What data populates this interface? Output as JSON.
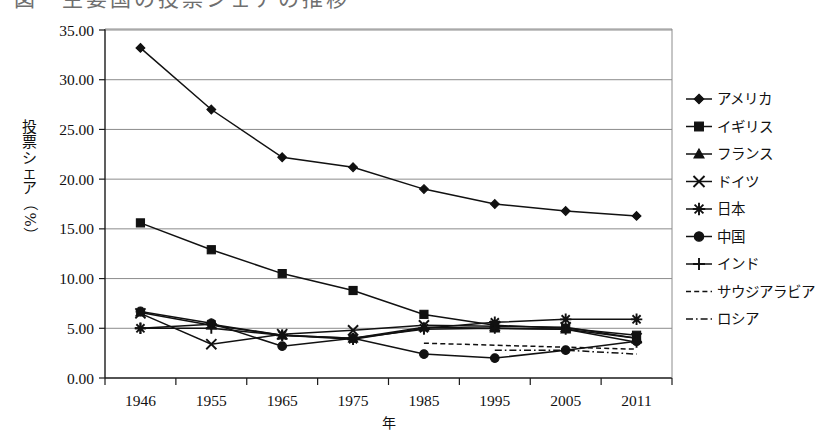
{
  "figure": {
    "title_clipped": "図　主要国の投票シェアの推移",
    "x_axis_title": "年",
    "y_axis_title_chars": [
      "投",
      "票",
      "シ",
      "ェ",
      "ア",
      "（",
      "%",
      "）"
    ],
    "colors": {
      "ink": "#111111",
      "grid": "#8c8c8c",
      "background": "#ffffff"
    }
  },
  "chart_data": {
    "type": "line",
    "title": "図　主要国の投票シェアの推移",
    "xlabel": "年",
    "ylabel": "投票シェア（%）",
    "categories": [
      "1946",
      "1955",
      "1965",
      "1975",
      "1985",
      "1995",
      "2005",
      "2011"
    ],
    "ylim": [
      0.0,
      35.0
    ],
    "ytick_step": 5.0,
    "ytick_labels": [
      "0.00",
      "5.00",
      "10.00",
      "15.00",
      "20.00",
      "25.00",
      "30.00",
      "35.00"
    ],
    "ytick_values": [
      0,
      5,
      10,
      15,
      20,
      25,
      30,
      35
    ],
    "grid": true,
    "grid_axis": "y",
    "legend_position": "right",
    "series": [
      {
        "name": "アメリカ",
        "marker": "diamond",
        "line": "solid",
        "values": [
          33.2,
          27.0,
          22.2,
          21.2,
          19.0,
          17.5,
          16.8,
          16.3
        ]
      },
      {
        "name": "イギリス",
        "marker": "square",
        "line": "solid",
        "values": [
          15.6,
          12.9,
          10.5,
          8.8,
          6.4,
          5.3,
          5.0,
          4.3
        ]
      },
      {
        "name": "フランス",
        "marker": "triangle",
        "line": "solid",
        "values": [
          6.6,
          5.3,
          4.3,
          4.0,
          5.1,
          5.0,
          4.9,
          4.0
        ]
      },
      {
        "name": "ドイツ",
        "marker": "x",
        "line": "solid",
        "values": [
          6.5,
          3.4,
          4.4,
          4.8,
          5.3,
          5.2,
          5.1,
          4.0
        ]
      },
      {
        "name": "日本",
        "marker": "asterisk",
        "line": "solid",
        "values": [
          5.0,
          5.4,
          4.3,
          3.9,
          5.0,
          5.6,
          5.9,
          5.9
        ]
      },
      {
        "name": "中国",
        "marker": "circle",
        "line": "solid",
        "values": [
          6.7,
          5.5,
          3.2,
          4.0,
          2.4,
          2.0,
          2.8,
          3.7
        ]
      },
      {
        "name": "インド",
        "marker": "plus",
        "line": "solid",
        "values": [
          5.0,
          5.0,
          4.3,
          4.0,
          4.9,
          5.0,
          4.9,
          3.6
        ]
      },
      {
        "name": "サウジアラビア",
        "marker": "none",
        "line": "dashed",
        "values": [
          null,
          null,
          null,
          null,
          3.5,
          3.3,
          3.1,
          2.9
        ]
      },
      {
        "name": "ロシア",
        "marker": "none",
        "line": "dashdot",
        "values": [
          null,
          null,
          null,
          null,
          null,
          2.8,
          2.8,
          2.4
        ]
      }
    ]
  },
  "legend": {
    "items": [
      {
        "label": "アメリカ",
        "marker": "diamond",
        "line": "solid"
      },
      {
        "label": "イギリス",
        "marker": "square",
        "line": "solid"
      },
      {
        "label": "フランス",
        "marker": "triangle",
        "line": "solid"
      },
      {
        "label": "ドイツ",
        "marker": "x",
        "line": "solid"
      },
      {
        "label": "日本",
        "marker": "asterisk",
        "line": "solid"
      },
      {
        "label": "中国",
        "marker": "circle",
        "line": "solid"
      },
      {
        "label": "インド",
        "marker": "plus",
        "line": "solid"
      },
      {
        "label": "サウジアラビア",
        "marker": "none",
        "line": "dashed"
      },
      {
        "label": "ロシア",
        "marker": "none",
        "line": "dashdot"
      }
    ]
  }
}
